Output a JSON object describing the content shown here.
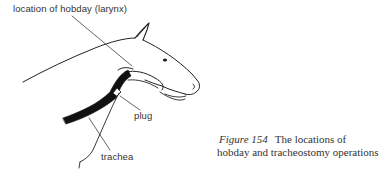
{
  "figure": {
    "labels": {
      "hobday": "location of hobday (larynx)",
      "plug": "plug",
      "trachea": "trachea"
    },
    "caption": {
      "figure_number": "Figure 154",
      "line1": "The locations of",
      "line2": "hobday and tracheostomy operations"
    },
    "colors": {
      "ink": "#222222",
      "text": "#333333",
      "background": "#ffffff"
    }
  }
}
